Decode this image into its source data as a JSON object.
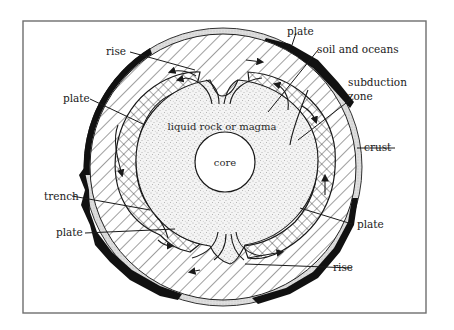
{
  "figure": {
    "type": "cross-section diagram",
    "colors": {
      "background": "#ffffff",
      "frame": "#6e6e6e",
      "ink": "#1a1a1a",
      "soil_band": "#111111",
      "crust_band": "#cfcfcf",
      "magma_stipple": "#8a8a8a"
    }
  },
  "labels": {
    "plate_top": "plate",
    "soil_and_oceans": "soil and oceans",
    "rise_top": "rise",
    "subduction_zone_line1": "subduction",
    "subduction_zone_line2": "zone",
    "plate_left": "plate",
    "liquid_rock": "liquid rock or magma",
    "core": "core",
    "crust": "crust",
    "trench": "trench",
    "plate_lower_left": "plate",
    "plate_lower_right": "plate",
    "rise_bottom": "rise"
  },
  "layers": [
    {
      "name": "soil and oceans",
      "fill": "black irregular band"
    },
    {
      "name": "crust",
      "fill": "light stippled ring"
    },
    {
      "name": "plate",
      "fill": "diagonal hatching"
    },
    {
      "name": "subduction / convecting plate",
      "fill": "cross-hatching"
    },
    {
      "name": "liquid rock or magma",
      "fill": "stipple"
    },
    {
      "name": "core",
      "fill": "white"
    }
  ]
}
